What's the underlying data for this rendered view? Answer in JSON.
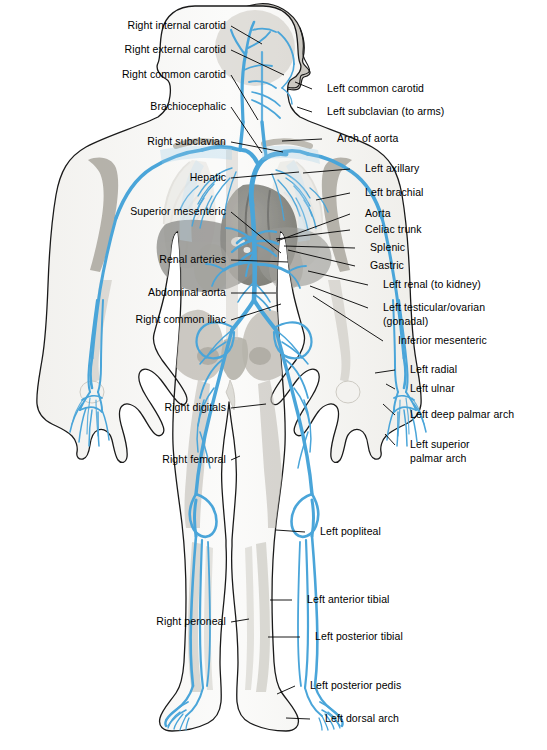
{
  "figure": {
    "view": "anterior whole-body arterial map with head in right profile",
    "colors": {
      "vessel_blue": "#4aa5d9",
      "vessel_blue_light": "#a8d4ec",
      "vessel_blue_dark": "#2e87bf",
      "body_gray": "#c9c6bf",
      "organ_gray": "#8d8d8a",
      "organ_dark_gray": "#6e6e6b",
      "bone_gray": "#bcb9b1",
      "outline_black": "#1a1a1a",
      "leader_line": "#000000",
      "background": "#ffffff"
    }
  },
  "labels_left": [
    {
      "id": "right-internal-carotid",
      "text": "Right internal carotid",
      "x": 226,
      "y": 26,
      "line": [
        [
          231,
          26
        ],
        [
          262,
          44
        ]
      ]
    },
    {
      "id": "right-external-carotid",
      "text": "Right external carotid",
      "x": 226,
      "y": 50,
      "line": [
        [
          231,
          50
        ],
        [
          284,
          75
        ]
      ]
    },
    {
      "id": "right-common-carotid",
      "text": "Right common carotid",
      "x": 226,
      "y": 75,
      "line": [
        [
          231,
          75
        ],
        [
          258,
          120
        ]
      ]
    },
    {
      "id": "brachiocephalic",
      "text": "Brachiocephalic",
      "x": 226,
      "y": 107,
      "line": [
        [
          231,
          107
        ],
        [
          262,
          153
        ]
      ]
    },
    {
      "id": "right-subclavian",
      "text": "Right subclavian",
      "x": 226,
      "y": 142,
      "line": [
        [
          231,
          142
        ],
        [
          283,
          152
        ]
      ]
    },
    {
      "id": "hepatic",
      "text": "Hepatic",
      "x": 226,
      "y": 178,
      "line": [
        [
          231,
          178
        ],
        [
          299,
          172
        ]
      ]
    },
    {
      "id": "superior-mesenteric",
      "text": "Superior mesenteric",
      "x": 226,
      "y": 212,
      "line": [
        [
          231,
          212
        ],
        [
          281,
          253
        ]
      ]
    },
    {
      "id": "renal-arteries",
      "text": "Renal arteries",
      "x": 226,
      "y": 260,
      "line": [
        [
          231,
          260
        ],
        [
          288,
          262
        ]
      ]
    },
    {
      "id": "abdominal-aorta",
      "text": "Abdominal aorta",
      "x": 226,
      "y": 293,
      "line": [
        [
          231,
          293
        ],
        [
          276,
          293
        ]
      ]
    },
    {
      "id": "right-common-iliac",
      "text": "Right common iliac",
      "x": 226,
      "y": 320,
      "line": [
        [
          231,
          320
        ],
        [
          281,
          304
        ]
      ]
    },
    {
      "id": "right-digitals",
      "text": "Right digitals",
      "x": 226,
      "y": 408,
      "line": [
        [
          231,
          408
        ],
        [
          266,
          404
        ]
      ]
    },
    {
      "id": "right-femoral",
      "text": "Right femoral",
      "x": 226,
      "y": 460,
      "line": [
        [
          231,
          460
        ],
        [
          240,
          456
        ]
      ]
    },
    {
      "id": "right-peroneal",
      "text": "Right peroneal",
      "x": 226,
      "y": 622,
      "line": [
        [
          231,
          622
        ],
        [
          249,
          619
        ]
      ]
    }
  ],
  "labels_right": [
    {
      "id": "left-common-carotid",
      "text": "Left common carotid",
      "x": 327,
      "y": 89,
      "line": [
        [
          312,
          89
        ],
        [
          295,
          82
        ]
      ]
    },
    {
      "id": "left-subclavian",
      "text": "Left subclavian (to arms)",
      "x": 327,
      "y": 112,
      "line": [
        [
          312,
          112
        ],
        [
          297,
          107
        ]
      ]
    },
    {
      "id": "arch-of-aorta",
      "text": "Arch of aorta",
      "x": 337,
      "y": 139,
      "line": [
        [
          322,
          139
        ],
        [
          282,
          141
        ]
      ]
    },
    {
      "id": "left-axillary",
      "text": "Left axillary",
      "x": 365,
      "y": 169,
      "line": [
        [
          350,
          169
        ],
        [
          303,
          173
        ]
      ]
    },
    {
      "id": "left-brachial",
      "text": "Left brachial",
      "x": 365,
      "y": 193,
      "line": [
        [
          350,
          193
        ],
        [
          316,
          200
        ]
      ]
    },
    {
      "id": "aorta",
      "text": "Aorta",
      "x": 365,
      "y": 214,
      "line": [
        [
          350,
          214
        ],
        [
          277,
          241
        ]
      ]
    },
    {
      "id": "celiac-trunk",
      "text": "Celiac trunk",
      "x": 365,
      "y": 230,
      "line": [
        [
          350,
          230
        ],
        [
          276,
          239
        ]
      ]
    },
    {
      "id": "splenic",
      "text": "Splenic",
      "x": 370,
      "y": 248,
      "line": [
        [
          355,
          248
        ],
        [
          284,
          246
        ]
      ]
    },
    {
      "id": "gastric",
      "text": "Gastric",
      "x": 370,
      "y": 266,
      "line": [
        [
          355,
          266
        ],
        [
          288,
          250
        ]
      ]
    },
    {
      "id": "left-renal",
      "text": "Left renal (to kidney)",
      "x": 383,
      "y": 285,
      "line": [
        [
          368,
          285
        ],
        [
          308,
          271
        ]
      ]
    },
    {
      "id": "left-testicular-ovarian",
      "text": "Left testicular/ovarian",
      "x": 383,
      "y": 308,
      "line": [
        [
          368,
          308
        ],
        [
          310,
          286
        ]
      ]
    },
    {
      "id": "left-gonadal-2",
      "text": "(gonadal)",
      "x": 383,
      "y": 322,
      "line": null
    },
    {
      "id": "inferior-mesenteric",
      "text": "Inferior mesenteric",
      "x": 398,
      "y": 341,
      "line": [
        [
          383,
          341
        ],
        [
          313,
          296
        ]
      ]
    },
    {
      "id": "left-radial",
      "text": "Left radial",
      "x": 410,
      "y": 370,
      "line": [
        [
          395,
          370
        ],
        [
          375,
          373
        ]
      ]
    },
    {
      "id": "left-ulnar",
      "text": "Left ulnar",
      "x": 410,
      "y": 389,
      "line": [
        [
          395,
          389
        ],
        [
          386,
          384
        ]
      ]
    },
    {
      "id": "left-deep-palmar-arch",
      "text": "Left deep palmar arch",
      "x": 410,
      "y": 415,
      "line": [
        [
          395,
          415
        ],
        [
          383,
          404
        ]
      ]
    },
    {
      "id": "left-superior-palmar-arch",
      "text": "Left superior",
      "x": 410,
      "y": 445,
      "line": [
        [
          395,
          445
        ],
        [
          385,
          434
        ]
      ]
    },
    {
      "id": "left-superior-palmar-arch-2",
      "text": "palmar arch",
      "x": 410,
      "y": 459,
      "line": null
    },
    {
      "id": "left-popliteal",
      "text": "Left popliteal",
      "x": 320,
      "y": 532,
      "line": [
        [
          305,
          532
        ],
        [
          276,
          530
        ]
      ]
    },
    {
      "id": "left-anterior-tibial",
      "text": "Left anterior tibial",
      "x": 307,
      "y": 600,
      "line": [
        [
          292,
          600
        ],
        [
          270,
          600
        ]
      ]
    },
    {
      "id": "left-posterior-tibial",
      "text": "Left posterior tibial",
      "x": 315,
      "y": 637,
      "line": [
        [
          300,
          637
        ],
        [
          268,
          637
        ]
      ]
    },
    {
      "id": "left-posterior-pedis",
      "text": "Left posterior pedis",
      "x": 310,
      "y": 686,
      "line": [
        [
          295,
          686
        ],
        [
          277,
          694
        ]
      ]
    },
    {
      "id": "left-dorsal-arch",
      "text": "Left dorsal arch",
      "x": 325,
      "y": 719,
      "line": [
        [
          310,
          719
        ],
        [
          286,
          718
        ]
      ]
    }
  ]
}
